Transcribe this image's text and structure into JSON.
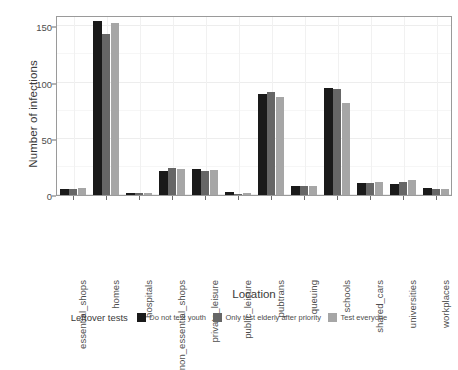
{
  "chart_data": {
    "type": "bar",
    "title": "",
    "subtitle": "",
    "xlabel": "Location",
    "ylabel": "Number of infections",
    "ylim": [
      0,
      160
    ],
    "yticks": [
      0,
      50,
      100,
      150
    ],
    "ytick_labels": [
      "0",
      "50",
      "100",
      "150"
    ],
    "grid": true,
    "grid_axis": "both",
    "legend_position": "bottom",
    "legend_title": "Leftover tests",
    "bar_mode": "grouped",
    "categories": [
      "essential_shops",
      "homes",
      "hospitals",
      "non_essential_shops",
      "private_leisure",
      "public_leisure",
      "pubtrans",
      "queuing",
      "schools",
      "shared_cars",
      "universities",
      "workplaces"
    ],
    "series": [
      {
        "name": "Do not test youth",
        "color": "#1a1a1a",
        "values": [
          5,
          155,
          2,
          21,
          23,
          3,
          90,
          8,
          95,
          11,
          10,
          6
        ]
      },
      {
        "name": "Only test elderly after priority",
        "color": "#666666",
        "values": [
          5,
          143,
          2,
          24,
          21,
          1,
          92,
          8,
          94,
          11,
          12,
          5
        ]
      },
      {
        "name": "Test everyone",
        "color": "#a6a6a6",
        "values": [
          6,
          153,
          2,
          23,
          22,
          2,
          87,
          8,
          82,
          12,
          13,
          5
        ]
      }
    ]
  },
  "axes": {
    "y_title": "Number of infections",
    "x_title": "Location"
  },
  "legend": {
    "title": "Leftover tests",
    "entries": [
      {
        "label": "Do not test youth",
        "color": "#1a1a1a"
      },
      {
        "label": "Only test elderly after priority",
        "color": "#666666"
      },
      {
        "label": "Test everyone",
        "color": "#a6a6a6"
      }
    ]
  },
  "colors": {
    "panel_border": "#9a9a9a",
    "grid_major": "#ededed",
    "grid_minor": "#f6f6f6",
    "background": "#ffffff",
    "text": "#4d4d4d"
  }
}
